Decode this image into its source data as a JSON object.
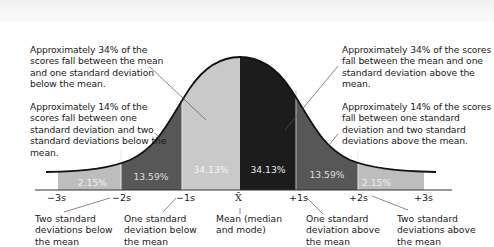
{
  "annotations": {
    "left_34": "Approximately 34% of the scores fall between the mean and one standard deviation below the mean.",
    "left_14": "Approximately 14% of the scores fall between one standard deviation and two standard deviations below the mean.",
    "right_34": "Approximately 34% of the scores fall between the mean and one standard deviation above the mean.",
    "right_14": "Approximately 14% of the scores fall between one standard deviation and two standard deviations above the mean."
  },
  "region_labels": {
    "left_tail": "2.15%",
    "left_mid": "13.59%",
    "left_center": "34.13%",
    "right_center": "34.13%",
    "right_mid": "13.59%",
    "right_tail": "2.15%"
  },
  "ticks": {
    "m3": "−3s",
    "m2": "−2s",
    "m1": "−1s",
    "mean": "X̄",
    "p1": "+1s",
    "p2": "+2s",
    "p3": "+3s"
  },
  "captions": {
    "m2": "Two standard deviations below the mean",
    "m1": "One standard deviation below the mean",
    "mean": "Mean (median and mode)",
    "p1": "One standard deviation above the mean",
    "p2": "Two standard deviations above the mean"
  },
  "colors": {
    "tail": "#bdbdbd",
    "mid": "#575757",
    "center_left": "#c9c9c9",
    "center_right": "#1c1c1c"
  }
}
